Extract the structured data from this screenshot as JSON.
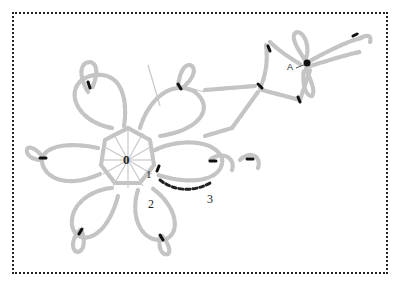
{
  "diagram": {
    "type": "crochet-stitch-chart",
    "frame_style": "dotted-border",
    "labels": {
      "center": "0",
      "round_1": "1",
      "round_2": "2",
      "round_3": "3",
      "start_point": "A"
    },
    "colors": {
      "chain_stitch": "#c4c4c4",
      "marker": "#111111",
      "highlight_chain": "#222222",
      "border": "#222222",
      "background": "#ffffff"
    },
    "elements": {
      "center_ring_stitches": 12,
      "petals": 6,
      "picots": 5,
      "branch_motif": "four-leaf loop with center point A"
    }
  }
}
